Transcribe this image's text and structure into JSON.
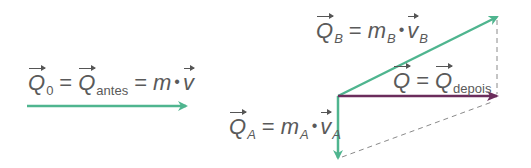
{
  "colors": {
    "green": "#4fb58f",
    "purple": "#6b2d5c",
    "dashed": "#8a8a8a",
    "text": "#5a5a5a"
  },
  "labels": {
    "initial": {
      "q0_symbol": "Q",
      "q0_sub": "0",
      "eq1": "=",
      "qantes_symbol": "Q",
      "qantes_sub": "antes",
      "eq2": "=",
      "mass": "m",
      "dot": "•",
      "velocity": "v"
    },
    "qb": {
      "symbol": "Q",
      "sub": "B",
      "eq": "=",
      "mass": "m",
      "mass_sub": "B",
      "dot": "•",
      "velocity": "v",
      "velocity_sub": "B"
    },
    "qa": {
      "symbol": "Q",
      "sub": "A",
      "eq": "=",
      "mass": "m",
      "mass_sub": "A",
      "dot": "•",
      "velocity": "v",
      "velocity_sub": "A"
    },
    "qdepois": {
      "symbol": "Q",
      "eq": "=",
      "symbol2": "Q",
      "sub": "depois"
    }
  },
  "vectors": [
    {
      "name": "Q0",
      "from": [
        27,
        106
      ],
      "to": [
        186,
        106
      ],
      "color": "green"
    },
    {
      "name": "QB",
      "from": [
        338,
        96
      ],
      "to": [
        497,
        17
      ],
      "color": "green"
    },
    {
      "name": "QA",
      "from": [
        338,
        96
      ],
      "to": [
        338,
        158
      ],
      "color": "green"
    },
    {
      "name": "Qdepois",
      "from": [
        338,
        96
      ],
      "to": [
        497,
        96
      ],
      "color": "purple"
    }
  ],
  "construction_lines": [
    {
      "from": [
        497,
        17
      ],
      "to": [
        497,
        96
      ],
      "style": "dashed"
    },
    {
      "from": [
        340,
        157
      ],
      "to": [
        490,
        103
      ],
      "style": "dashed"
    }
  ]
}
